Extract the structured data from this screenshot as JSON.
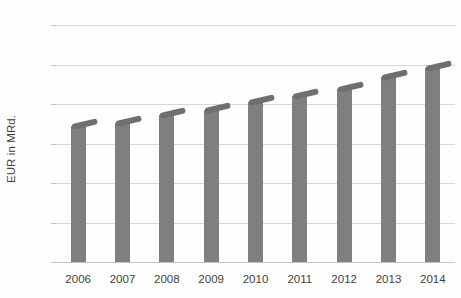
{
  "chart_data": {
    "type": "bar",
    "title": "",
    "subtitle": "",
    "xlabel": "",
    "ylabel": "EUR in MRd.",
    "categories": [
      "2006",
      "2007",
      "2008",
      "2009",
      "2010",
      "2011",
      "2012",
      "2013",
      "2014"
    ],
    "values": [
      17.2,
      17.6,
      18.6,
      19.2,
      20.3,
      21.0,
      21.9,
      23.4,
      24.6
    ],
    "series": [
      {
        "name": "EUR in MRd.",
        "values": [
          17.2,
          17.6,
          18.6,
          19.2,
          20.3,
          21.0,
          21.9,
          23.4,
          24.6
        ]
      }
    ],
    "ylim": [
      0,
      30
    ],
    "y_ticks": [
      0,
      5,
      10,
      15,
      20,
      25,
      30
    ],
    "y_tick_labels": [
      "0",
      "5",
      "10",
      "15",
      "20",
      "25",
      "30"
    ],
    "grid": true,
    "grid_axis": "y",
    "legend": false,
    "legend_position": "none",
    "bar_color": "#7f7f7f",
    "bar_cap_color": "#6f6f6f",
    "gridline_color": "#d6d6d6",
    "axis_color": "#c2c2c2",
    "text_color": "#3f3f3f",
    "background_color": "#ffffff",
    "annotations": []
  }
}
